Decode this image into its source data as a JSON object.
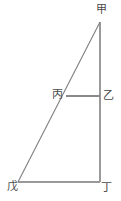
{
  "figure": {
    "type": "geometry-diagram",
    "background_color": "#ffffff",
    "stroke_color": "#8c8c8c",
    "stroke_color_dark": "#6f6f6f",
    "label_color": "#4a4a4a",
    "width": 121,
    "height": 201,
    "points": {
      "jia": {
        "label": "甲",
        "x": 100,
        "y": 22
      },
      "yi": {
        "label": "乙",
        "x": 100,
        "y": 96
      },
      "bing": {
        "label": "丙",
        "x": 66,
        "y": 96
      },
      "wu": {
        "label": "戊",
        "x": 18,
        "y": 182
      },
      "ding": {
        "label": "丁",
        "x": 100,
        "y": 182
      }
    },
    "segments": [
      {
        "name": "jia-ding-vertical",
        "from": "jia",
        "to": "ding"
      },
      {
        "name": "wu-ding-base",
        "from": "wu",
        "to": "ding"
      },
      {
        "name": "wu-jia-hypotenuse",
        "from": "wu",
        "to": "jia"
      },
      {
        "name": "bing-yi-horizontal",
        "from": "bing",
        "to": "yi"
      }
    ]
  }
}
